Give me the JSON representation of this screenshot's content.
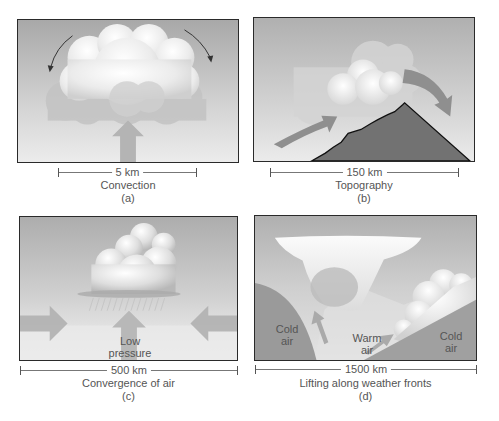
{
  "figure": {
    "panels": [
      {
        "id": "a",
        "scale_label": "5 km",
        "caption": "Convection",
        "letter": "(a)"
      },
      {
        "id": "b",
        "scale_label": "150 km",
        "caption": "Topography",
        "letter": "(b)"
      },
      {
        "id": "c",
        "scale_label": "500 km",
        "caption": "Convergence of air",
        "letter": "(c)",
        "labels": {
          "low_pressure_line1": "Low",
          "low_pressure_line2": "pressure"
        }
      },
      {
        "id": "d",
        "scale_label": "1500 km",
        "caption": "Lifting along weather fronts",
        "letter": "(d)",
        "labels": {
          "cold_air_left_line1": "Cold",
          "cold_air_left_line2": "air",
          "warm_air_line1": "Warm",
          "warm_air_line2": "air",
          "cold_air_right_line1": "Cold",
          "cold_air_right_line2": "air"
        }
      }
    ],
    "colors": {
      "sky_top": "#a9a9a9",
      "sky_bottom": "#e6e6e6",
      "cloud": "#f2f2f2",
      "cloud_shadow": "#c4c4c4",
      "arrow": "#8f8f8f",
      "mountain": "#737373",
      "cold_air": "#9a9a9a",
      "border": "#2a2a2a"
    }
  }
}
